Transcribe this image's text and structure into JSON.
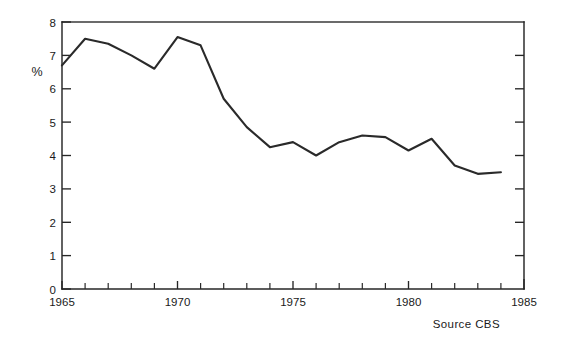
{
  "figure": {
    "background_color": "#ffffff",
    "ink_color": "#262626",
    "width": 562,
    "height": 347
  },
  "labels": {
    "y_axis_label": "%",
    "source_note": "Source  CBS"
  },
  "chart_data": {
    "type": "line",
    "title": "",
    "subtitle": "",
    "xlabel": "",
    "ylabel": "%",
    "xlim": [
      1965,
      1985
    ],
    "ylim": [
      0,
      8
    ],
    "grid": false,
    "legend": false,
    "legend_position": "none",
    "x_tick_labels": [
      "1965",
      "1970",
      "1975",
      "1980",
      "1985"
    ],
    "x_tick_values": [
      1965,
      1970,
      1975,
      1980,
      1985
    ],
    "x_minor_tick_step": 1,
    "y_tick_labels": [
      "0",
      "1",
      "2",
      "3",
      "4",
      "5",
      "6",
      "7",
      "8"
    ],
    "y_tick_values": [
      0,
      1,
      2,
      3,
      4,
      5,
      6,
      7,
      8
    ],
    "annotations": [
      {
        "text": "Source  CBS",
        "x": 1983.2,
        "y": -1.05,
        "align": "right"
      }
    ],
    "series": [
      {
        "name": "percentage",
        "x": [
          1965,
          1966,
          1967,
          1968,
          1969,
          1970,
          1971,
          1972,
          1973,
          1974,
          1975,
          1976,
          1977,
          1978,
          1979,
          1980,
          1981,
          1982,
          1983,
          1984
        ],
        "values": [
          6.7,
          7.5,
          7.35,
          7.0,
          6.6,
          7.55,
          7.3,
          5.7,
          4.85,
          4.25,
          4.4,
          4.0,
          4.4,
          4.6,
          4.55,
          4.15,
          4.5,
          3.7,
          3.45,
          3.5
        ]
      }
    ]
  },
  "derived_points": {
    "note_count": 20
  }
}
